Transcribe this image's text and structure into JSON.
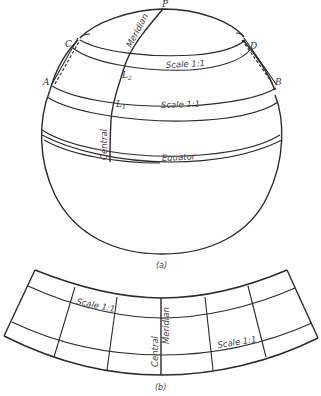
{
  "figure_a": {
    "caption": "(a)",
    "points": {
      "pole": "P",
      "c": "C",
      "d": "D",
      "a": "A",
      "b": "B",
      "l1": "L",
      "l1_sub": "1",
      "l2": "L",
      "l2_sub": "2"
    },
    "labels": {
      "meridian": "Meridian",
      "central": "Central",
      "scale_upper": "Scale 1:1",
      "scale_lower": "Scale 1:1",
      "equator": "Equator"
    }
  },
  "figure_b": {
    "caption": "(b)",
    "labels": {
      "scale_left": "Scale 1:1",
      "scale_right": "Scale 1:1",
      "central": "Central",
      "meridian": "Meridian"
    }
  },
  "colors": {
    "line": "#2a2a2a",
    "text": "#333333",
    "background": "#ffffff"
  }
}
